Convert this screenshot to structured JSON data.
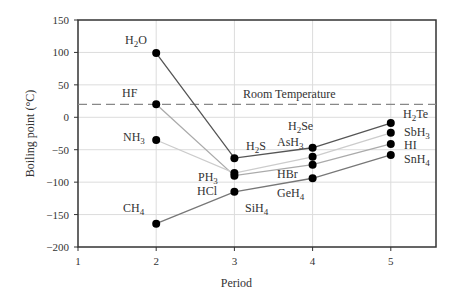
{
  "chart_data": {
    "type": "line",
    "title": "",
    "xlabel": "Period",
    "ylabel": "Boiling point (°C)",
    "xlim": [
      1,
      5.6
    ],
    "ylim": [
      -200,
      150
    ],
    "xticks": [
      1,
      2,
      3,
      4,
      5
    ],
    "yticks": [
      150,
      100,
      50,
      0,
      -50,
      -100,
      -150,
      -200
    ],
    "grid": true,
    "reference_line": {
      "label": "Room Temperature",
      "y": 20,
      "style": "dashed"
    },
    "series": [
      {
        "name": "Group 16 (H2O family)",
        "color": "#555555",
        "points": [
          {
            "x": 2,
            "y": 99,
            "label": "H2O"
          },
          {
            "x": 3,
            "y": -63,
            "label": "H2S"
          },
          {
            "x": 4,
            "y": -47,
            "label": "H2Se"
          },
          {
            "x": 5,
            "y": -9,
            "label": "H2Te"
          }
        ]
      },
      {
        "name": "Group 17 (HF family)",
        "color": "#aaaaaa",
        "points": [
          {
            "x": 2,
            "y": 20,
            "label": "HF"
          },
          {
            "x": 3,
            "y": -90,
            "label": "HCl"
          },
          {
            "x": 4,
            "y": -73,
            "label": "HBr"
          },
          {
            "x": 5,
            "y": -41,
            "label": "HI"
          }
        ]
      },
      {
        "name": "Group 15 (NH3 family)",
        "color": "#cccccc",
        "points": [
          {
            "x": 2,
            "y": -35,
            "label": "NH3"
          },
          {
            "x": 3,
            "y": -86,
            "label": "PH3"
          },
          {
            "x": 4,
            "y": -61,
            "label": "AsH3"
          },
          {
            "x": 5,
            "y": -24,
            "label": "SbH3"
          }
        ]
      },
      {
        "name": "Group 14 (CH4 family)",
        "color": "#777777",
        "points": [
          {
            "x": 2,
            "y": -164,
            "label": "CH4"
          },
          {
            "x": 3,
            "y": -115,
            "label": "SiH4"
          },
          {
            "x": 4,
            "y": -94,
            "label": "GeH4"
          },
          {
            "x": 5,
            "y": -58,
            "label": "SnH4"
          }
        ]
      }
    ]
  }
}
